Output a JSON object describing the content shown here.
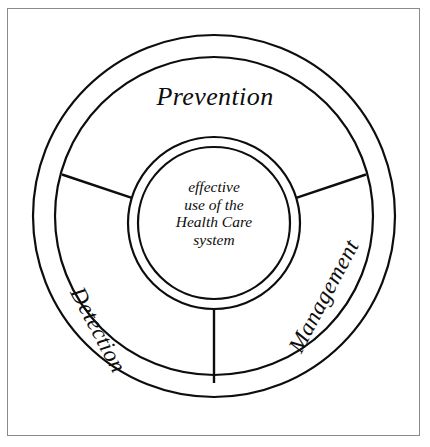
{
  "diagram": {
    "title": "effective use of the Health Care system",
    "type": "concentric-ring-segmented-circle",
    "background_color": "#ffffff",
    "stroke_color": "#0d0d0d",
    "frame_color": "#8a8a8a",
    "center": {
      "lines": [
        "effective",
        "use of the",
        "Health Care",
        "system"
      ]
    },
    "segments": [
      {
        "id": "prevention",
        "label": "Prevention",
        "position": "top",
        "rotation_deg": 0
      },
      {
        "id": "detection",
        "label": "Detection",
        "position": "lower-left",
        "rotation_deg": 62
      },
      {
        "id": "management",
        "label": "Management",
        "position": "lower-right",
        "rotation_deg": -62
      }
    ],
    "geometry": {
      "outer_ring": {
        "cx": 214,
        "cy": 216,
        "r_outer": 181,
        "r_inner": 159
      },
      "inner_hub": {
        "cx": 214,
        "cy": 223,
        "r_outer": 86,
        "r_inner": 76
      },
      "divider_angles_deg": [
        197,
        343,
        90
      ]
    }
  }
}
